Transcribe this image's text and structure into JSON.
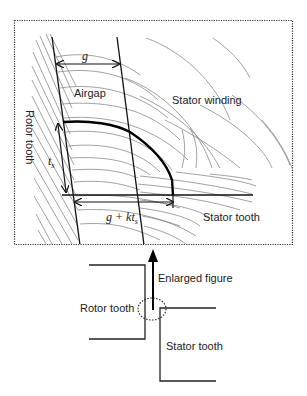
{
  "diagram": {
    "type": "electric machine airgap flux diagram",
    "enlarged_view": {
      "labels": {
        "gap_symbol": "g",
        "airgap": "Airgap",
        "stator_winding": "Stator winding",
        "rotor_tooth": "Rotor tooth",
        "ts_symbol": "t",
        "ts_subscript": "s",
        "extended_gap_prefix": "g + kt",
        "extended_gap_subscript": "s",
        "stator_tooth": "Stator tooth"
      }
    },
    "overview": {
      "labels": {
        "enlarged_figure": "Enlarged figure",
        "rotor_tooth": "Rotor tooth",
        "stator_tooth": "Stator tooth"
      }
    },
    "colors": {
      "line": "#111111",
      "flux_line": "#8a8a8a",
      "border": "#333333",
      "background": "#ffffff"
    }
  }
}
